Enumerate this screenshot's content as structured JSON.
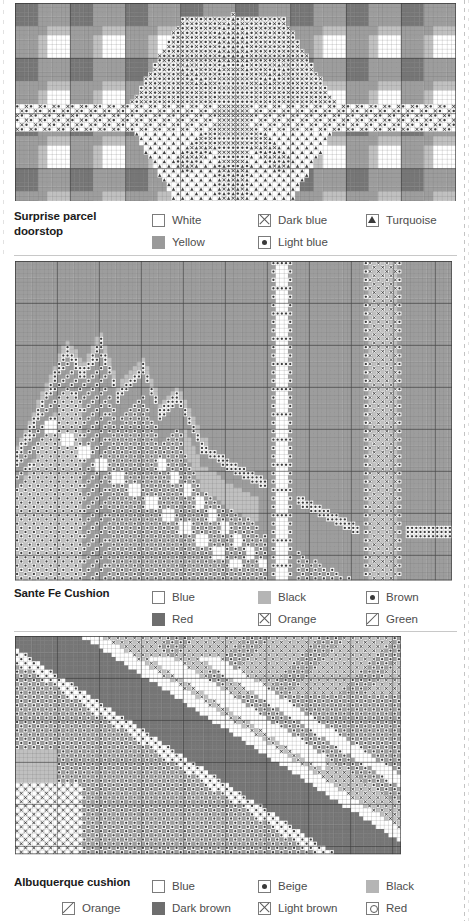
{
  "page": {
    "background": "#ffffff",
    "text_color": "#231f20",
    "label_color": "#4d4d4d",
    "symbol_stroke": "#7b7b7b"
  },
  "charts": [
    {
      "id": "surprise-parcel-doorstop",
      "title": "Surprise parcel\ndoorstop",
      "title_line1": "Surprise parcel",
      "title_line2": "doorstop",
      "grid": {
        "cols": 96,
        "rows": 48,
        "x": 15,
        "y": 3,
        "width": 441,
        "height": 198
      },
      "pattern": "gingham-plaid-with-star-motif",
      "legend": [
        {
          "label": "White",
          "symbol": "empty-square",
          "swatch": "#ffffff"
        },
        {
          "label": "Dark blue",
          "symbol": "x-square",
          "swatch": "#6e6e6e"
        },
        {
          "label": "Turquoise",
          "symbol": "triangle-square",
          "swatch": "#3a3a3a"
        },
        {
          "label": "Yellow",
          "symbol": "filled-square",
          "swatch": "#9a9a9a"
        },
        {
          "label": "Light blue",
          "symbol": "dot-square",
          "swatch": "#4a4a4a"
        }
      ],
      "legend_rows": [
        [
          "White",
          "Dark blue",
          "Turquoise"
        ],
        [
          "Yellow",
          "Light blue"
        ]
      ]
    },
    {
      "id": "sante-fe-cushion",
      "title": "Sante Fe Cushion",
      "title_line1": "Sante Fe Cushion",
      "title_line2": "",
      "grid": {
        "cols": 104,
        "rows": 76,
        "x": 15,
        "y": 261,
        "width": 437,
        "height": 320
      },
      "pattern": "mountain-landscape-with-vertical-bands",
      "legend": [
        {
          "label": "Blue",
          "symbol": "empty-square",
          "swatch": "#ffffff"
        },
        {
          "label": "Black",
          "symbol": "filled-square",
          "swatch": "#9a9a9a"
        },
        {
          "label": "Brown",
          "symbol": "dot-square",
          "swatch": "#4a4a4a"
        },
        {
          "label": "Red",
          "symbol": "filled-square",
          "swatch": "#6e6e6e"
        },
        {
          "label": "Orange",
          "symbol": "x-square",
          "swatch": "#6e6e6e"
        },
        {
          "label": "Green",
          "symbol": "slash-square",
          "swatch": "#5a5a5a"
        }
      ],
      "legend_rows": [
        [
          "Blue",
          "Black",
          "Brown"
        ],
        [
          "Red",
          "Orange",
          "Green"
        ]
      ]
    },
    {
      "id": "albuquerque-cushion",
      "title": "Albuquerque cushion",
      "title_line1": "Albuquerque cushion",
      "title_line2": "",
      "grid": {
        "cols": 92,
        "rows": 52,
        "x": 15,
        "y": 636,
        "width": 386,
        "height": 232
      },
      "pattern": "diagonal-southwest-motif",
      "legend": [
        {
          "label": "Blue",
          "symbol": "empty-square",
          "swatch": "#ffffff"
        },
        {
          "label": "Beige",
          "symbol": "dot-square",
          "swatch": "#4a4a4a"
        },
        {
          "label": "Black",
          "symbol": "filled-square",
          "swatch": "#9a9a9a"
        },
        {
          "label": "Orange",
          "symbol": "slash-square",
          "swatch": "#5a5a5a"
        },
        {
          "label": "Dark brown",
          "symbol": "filled-square",
          "swatch": "#6e6e6e"
        },
        {
          "label": "Light brown",
          "symbol": "x-square",
          "swatch": "#6e6e6e"
        },
        {
          "label": "Red",
          "symbol": "circle-square",
          "swatch": "#5a5a5a"
        }
      ],
      "legend_rows": [
        [
          "Blue",
          "Beige",
          "Black"
        ],
        [
          "Orange",
          "Dark brown",
          "Light brown",
          "Red"
        ]
      ]
    }
  ],
  "chart_data": {
    "type": "heatmap",
    "panels": [
      {
        "name": "Surprise parcel doorstop",
        "grid_cols": 96,
        "grid_rows": 48,
        "symbols": [
          "empty-square",
          "filled-square",
          "x-square",
          "dot-square",
          "triangle-square"
        ],
        "colors": [
          "White",
          "Yellow",
          "Dark blue",
          "Light blue",
          "Turquoise"
        ]
      },
      {
        "name": "Sante Fe Cushion",
        "grid_cols": 104,
        "grid_rows": 76,
        "symbols": [
          "empty-square",
          "filled-square",
          "dot-square",
          "x-square",
          "slash-square"
        ],
        "colors": [
          "Blue",
          "Black",
          "Brown",
          "Red",
          "Orange",
          "Green"
        ]
      },
      {
        "name": "Albuquerque cushion",
        "grid_cols": 92,
        "grid_rows": 52,
        "symbols": [
          "empty-square",
          "dot-square",
          "filled-square",
          "slash-square",
          "x-square",
          "circle-square"
        ],
        "colors": [
          "Blue",
          "Beige",
          "Black",
          "Orange",
          "Dark brown",
          "Light brown",
          "Red"
        ]
      }
    ]
  }
}
